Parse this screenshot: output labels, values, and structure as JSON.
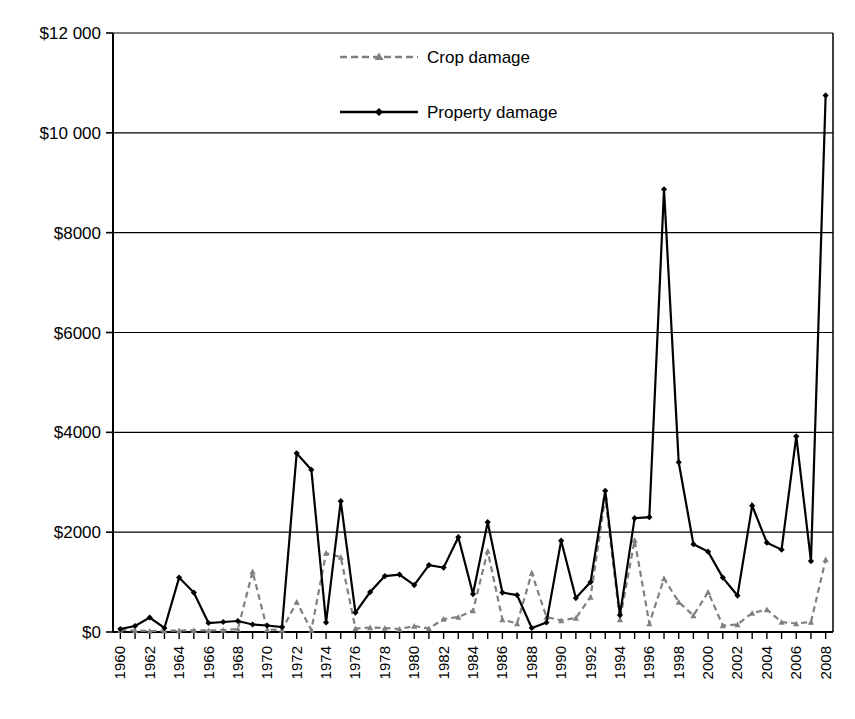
{
  "chart_data": {
    "type": "line",
    "title": "",
    "xlabel": "",
    "ylabel": "",
    "grid": true,
    "legend_position": "top-center",
    "ylim": [
      0,
      12000
    ],
    "ytick_labels": [
      "$12 000",
      "$10 000",
      "$8000",
      "$6000",
      "$4000",
      "$2000",
      "$0"
    ],
    "ytick_values": [
      12000,
      10000,
      8000,
      6000,
      4000,
      2000,
      0
    ],
    "xtick_labels": [
      "1960",
      "1962",
      "1964",
      "1966",
      "1968",
      "1970",
      "1972",
      "1974",
      "1976",
      "1978",
      "1980",
      "1982",
      "1984",
      "1986",
      "1988",
      "1990",
      "1992",
      "1994",
      "1996",
      "1998",
      "2000",
      "2002",
      "2004",
      "2006",
      "2008"
    ],
    "x": [
      1960,
      1961,
      1962,
      1963,
      1964,
      1965,
      1966,
      1967,
      1968,
      1969,
      1970,
      1971,
      1972,
      1973,
      1974,
      1975,
      1976,
      1977,
      1978,
      1979,
      1980,
      1981,
      1982,
      1983,
      1984,
      1985,
      1986,
      1987,
      1988,
      1989,
      1990,
      1991,
      1992,
      1993,
      1994,
      1995,
      1996,
      1997,
      1998,
      1999,
      2000,
      2001,
      2002,
      2003,
      2004,
      2005,
      2006,
      2007,
      2008
    ],
    "series": [
      {
        "name": "Crop damage",
        "style": "dashed",
        "marker": "triangle",
        "color": "#808080",
        "values": [
          40,
          30,
          20,
          25,
          30,
          35,
          30,
          40,
          60,
          1210,
          50,
          40,
          600,
          40,
          1580,
          1500,
          70,
          90,
          80,
          60,
          120,
          70,
          260,
          300,
          430,
          1620,
          250,
          170,
          1180,
          300,
          230,
          280,
          700,
          2700,
          250,
          1840,
          170,
          1070,
          600,
          330,
          800,
          130,
          150,
          380,
          450,
          200,
          170,
          200,
          1450
        ]
      },
      {
        "name": "Property damage",
        "style": "solid",
        "marker": "diamond",
        "color": "#000000",
        "values": [
          60,
          120,
          290,
          80,
          1090,
          790,
          180,
          200,
          220,
          150,
          130,
          100,
          3580,
          3250,
          190,
          2620,
          390,
          800,
          1120,
          1150,
          940,
          1340,
          1290,
          1900,
          760,
          2200,
          790,
          740,
          80,
          190,
          1830,
          680,
          1000,
          2830,
          340,
          2280,
          2300,
          8870,
          3400,
          1760,
          1610,
          1090,
          730,
          2530,
          1790,
          1650,
          3920,
          1420,
          10750
        ]
      }
    ]
  },
  "legend": {
    "items": [
      {
        "label": "Crop damage"
      },
      {
        "label": "Property damage"
      }
    ]
  }
}
